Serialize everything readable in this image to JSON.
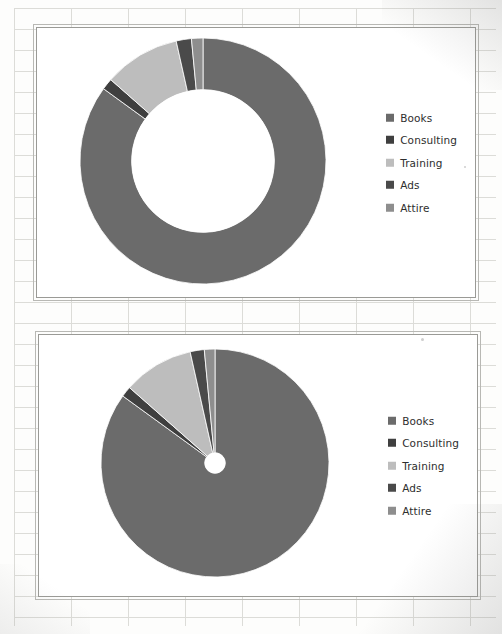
{
  "document": {
    "kind": "scanned-spreadsheet-page",
    "background": "#fdfdfc",
    "gridline_color": "#dcdcd8"
  },
  "palette": {
    "books": "#6b6b6b",
    "consulting": "#3f3f3f",
    "training": "#bdbdbd",
    "ads": "#4a4a4a",
    "attire": "#8e8e8e",
    "frame_border": "#9a9a96",
    "plot_background": "#ffffff",
    "legend_text": "#2e2e2e"
  },
  "charts": [
    {
      "id": "doughnut",
      "name": "Doughnut chart",
      "legend": {
        "position": "right",
        "items": [
          {
            "label": "Books",
            "color": "#6b6b6b"
          },
          {
            "label": "Consulting",
            "color": "#3f3f3f"
          },
          {
            "label": "Training",
            "color": "#bdbdbd"
          },
          {
            "label": "Ads",
            "color": "#4a4a4a"
          },
          {
            "label": "Attire",
            "color": "#8e8e8e"
          }
        ]
      }
    },
    {
      "id": "pie",
      "name": "Pie chart",
      "legend": {
        "position": "right",
        "items": [
          {
            "label": "Books",
            "color": "#6b6b6b"
          },
          {
            "label": "Consulting",
            "color": "#3f3f3f"
          },
          {
            "label": "Training",
            "color": "#bdbdbd"
          },
          {
            "label": "Ads",
            "color": "#4a4a4a"
          },
          {
            "label": "Attire",
            "color": "#8e8e8e"
          }
        ]
      }
    }
  ],
  "chart_data": [
    {
      "type": "pie",
      "variant": "doughnut",
      "title": "",
      "labels": [
        "Books",
        "Consulting",
        "Training",
        "Ads",
        "Attire"
      ],
      "values": [
        85,
        1.5,
        10,
        2,
        1.5
      ],
      "unit": "percent",
      "colors": [
        "#6b6b6b",
        "#3f3f3f",
        "#bdbdbd",
        "#4a4a4a",
        "#8e8e8e"
      ],
      "start_angle": 0,
      "direction": "clockwise",
      "hole_ratio": 0.58,
      "legend": "right",
      "data_labels": false,
      "grid": false
    },
    {
      "type": "pie",
      "variant": "pie",
      "title": "",
      "labels": [
        "Books",
        "Consulting",
        "Training",
        "Ads",
        "Attire"
      ],
      "values": [
        85,
        1.5,
        10,
        2,
        1.5
      ],
      "unit": "percent",
      "colors": [
        "#6b6b6b",
        "#3f3f3f",
        "#bdbdbd",
        "#4a4a4a",
        "#8e8e8e"
      ],
      "start_angle": 0,
      "direction": "clockwise",
      "hole_ratio": 0.09,
      "legend": "right",
      "data_labels": false,
      "grid": false
    }
  ]
}
